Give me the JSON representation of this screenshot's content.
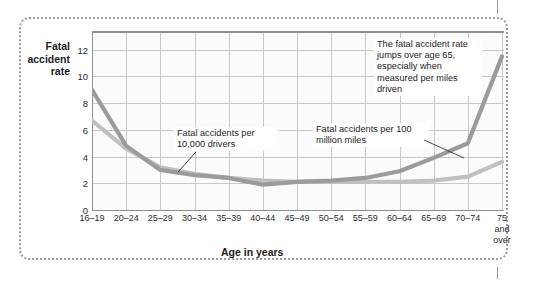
{
  "chart_data": {
    "type": "line",
    "title": "",
    "xlabel": "Age in years",
    "ylabel": "Fatal accident rate",
    "ylim": [
      0,
      13.4
    ],
    "yticks": [
      0,
      2,
      4,
      6,
      8,
      10,
      12
    ],
    "ytick_labels": [
      "0",
      "2",
      "4",
      "6",
      "8",
      "10",
      "12"
    ],
    "grid": true,
    "legend_position": "inline-annotations",
    "categories": [
      "16–19",
      "20–24",
      "25–29",
      "30–34",
      "35–39",
      "40–44",
      "45–49",
      "50–54",
      "55–59",
      "60–64",
      "65–69",
      "70–74",
      "75\nand\nover"
    ],
    "series": [
      {
        "name": "Fatal accidents per 100 million miles",
        "color": "#9b9b9b",
        "values": [
          9.0,
          4.8,
          3.0,
          2.6,
          2.4,
          1.9,
          2.1,
          2.2,
          2.4,
          2.9,
          3.9,
          5.0,
          11.5
        ]
      },
      {
        "name": "Fatal accidents per 10,000 drivers",
        "color": "#c0c0c0",
        "values": [
          6.7,
          4.6,
          3.2,
          2.7,
          2.4,
          2.2,
          2.1,
          2.1,
          2.1,
          2.1,
          2.2,
          2.5,
          3.6
        ]
      }
    ],
    "annotations": [
      {
        "name": "miles-note",
        "text": "The fatal accident rate jumps over age 65, especially when measured per miles driven"
      },
      {
        "name": "drivers-label",
        "text": "Fatal accidents per 10,000 drivers"
      },
      {
        "name": "miles-label",
        "text": "Fatal accidents per 100 million miles"
      }
    ]
  },
  "axis": {
    "y_title": "Fatal accident rate",
    "x_title": "Age in years"
  },
  "annotations": {
    "miles_note": "The fatal accident rate jumps over age 65, especially when measured per miles driven",
    "drivers_label": "Fatal accidents per 10,000 drivers",
    "miles_label": "Fatal accidents per 100 million miles"
  },
  "colors": {
    "series_miles": "#9b9b9b",
    "series_drivers": "#c0c0c0",
    "grid": "#c9c9c9",
    "axis": "#8f8f8f",
    "frame": "#9a9a9a",
    "text": "#1d1d1d"
  }
}
